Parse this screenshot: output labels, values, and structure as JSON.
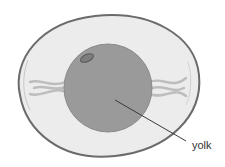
{
  "diagram": {
    "labels": [
      {
        "id": "yolk",
        "text": "yolk"
      }
    ]
  },
  "colors": {
    "shell_outline": "#6b6b6b",
    "albumen": "#ececec",
    "membrane": "#c8c8c8",
    "yolk": "#9a9a9a",
    "yolk_edge": "#8a8a8a",
    "germinal_disc": "#6e6e6e",
    "chalaza": "#bdbdbd",
    "leader_line": "#3a3a3a"
  }
}
